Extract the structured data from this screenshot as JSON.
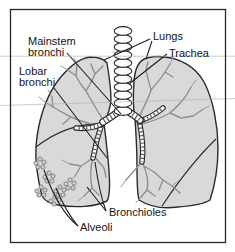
{
  "figure": {
    "labels": {
      "mainstem_bronchi": {
        "line1": "Mainstem",
        "line2": "bronchi"
      },
      "lobar_bronchi": {
        "line1": "Lobar",
        "line2": "bronchi"
      },
      "lungs": "Lungs",
      "trachea": "Trachea",
      "bronchioles": "Bronchioles",
      "alveoli": "Alveoli"
    },
    "colors": {
      "background": "#ffffff",
      "frame_border": "#2b2b2b",
      "lung_fill": "#d9d9d9",
      "lung_outline": "#2b2b2b",
      "bronchial_tree": "#8f8f8f",
      "bronchi_dark": "#3a3a3a",
      "leader_line": "#1f1f1f",
      "label_text": "#141414",
      "page_line": "#b3b3b3"
    }
  }
}
